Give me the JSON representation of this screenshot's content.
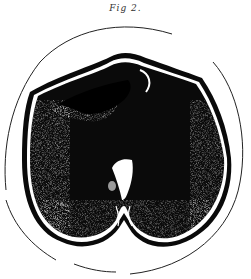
{
  "figure": {
    "caption": "Fig 2.",
    "colors": {
      "background": "#ffffff",
      "ink": "#0a0a0a",
      "outline": "#222222"
    }
  }
}
